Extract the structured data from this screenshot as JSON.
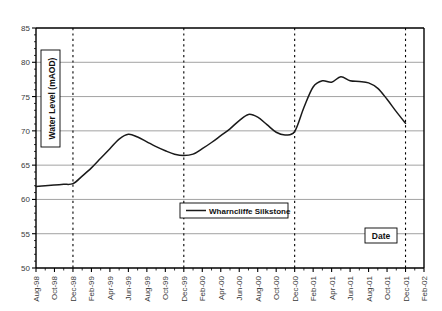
{
  "chart_data": {
    "type": "line",
    "title": "",
    "xlabel": "Date",
    "ylabel": "Water Level (mAOD)",
    "ylim": [
      50,
      85
    ],
    "ytick_step": 5,
    "yticks": [
      "50",
      "55",
      "60",
      "65",
      "70",
      "75",
      "80",
      "85"
    ],
    "grid": "horizontal-solid-gray; vertical-dotted-at-December",
    "legend_position": "inside-lower-center",
    "legend": [
      "Wharncliffe Silkstone"
    ],
    "xticks": [
      "Aug-98",
      "Oct-98",
      "Dec-98",
      "Feb-99",
      "Apr-99",
      "Jun-99",
      "Aug-99",
      "Oct-99",
      "Dec-99",
      "Feb-00",
      "Apr-00",
      "Jun-00",
      "Aug-00",
      "Oct-00",
      "Dec-00",
      "Feb-01",
      "Apr-01",
      "Jun-01",
      "Aug-01",
      "Oct-01",
      "Dec-01",
      "Feb-02"
    ],
    "vertical_gridlines": [
      "Dec-98",
      "Dec-99",
      "Dec-00",
      "Dec-01"
    ],
    "series": [
      {
        "name": "Wharncliffe Silkstone",
        "color": "#1a1a1a",
        "x": [
          "Aug-98",
          "Sep-98",
          "Oct-98",
          "Nov-98",
          "Dec-98",
          "Jan-99",
          "Feb-99",
          "Mar-99",
          "Apr-99",
          "May-99",
          "Jun-99",
          "Jul-99",
          "Aug-99",
          "Sep-99",
          "Oct-99",
          "Nov-99",
          "Dec-99",
          "Jan-00",
          "Feb-00",
          "Mar-00",
          "Apr-00",
          "May-00",
          "Jun-00",
          "Jul-00",
          "Aug-00",
          "Sep-00",
          "Oct-00",
          "Nov-00",
          "Dec-00",
          "Jan-01",
          "Feb-01",
          "Mar-01",
          "Apr-01",
          "May-01",
          "Jun-01",
          "Jul-01",
          "Aug-01",
          "Sep-01",
          "Oct-01",
          "Nov-01",
          "Dec-01"
        ],
        "values": [
          61.9,
          62.0,
          62.1,
          62.2,
          62.3,
          63.4,
          64.6,
          66.0,
          67.4,
          68.8,
          69.5,
          69.1,
          68.4,
          67.7,
          67.1,
          66.6,
          66.4,
          66.6,
          67.4,
          68.3,
          69.3,
          70.3,
          71.5,
          72.4,
          72.0,
          70.9,
          69.8,
          69.4,
          69.9,
          73.4,
          76.4,
          77.3,
          77.1,
          77.9,
          77.3,
          77.2,
          77.0,
          76.2,
          74.6,
          72.8,
          71.1
        ]
      }
    ]
  },
  "axis_title_y": "Water Level (mAOD)",
  "axis_title_x": "Date",
  "legend_label": "Wharncliffe Silkstone"
}
